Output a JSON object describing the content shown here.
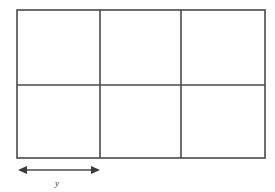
{
  "figure": {
    "title": "",
    "background_color": "#ffffff",
    "line_color": "#4a4a4a",
    "label_color": "#3a3a3a",
    "line_width": 1.6
  },
  "grid": {
    "columns": 3,
    "rows": 2,
    "outer": {
      "x": 17,
      "y": 10,
      "width": 248,
      "height": 148
    },
    "vertical_dividers_x": [
      100,
      181
    ],
    "horizontal_dividers_y": [
      85
    ],
    "cells": [
      {
        "name": "cell-r1-c1",
        "row": 1,
        "col": 1,
        "label": ""
      },
      {
        "name": "cell-r1-c2",
        "row": 1,
        "col": 2,
        "label": ""
      },
      {
        "name": "cell-r1-c3",
        "row": 1,
        "col": 3,
        "label": ""
      },
      {
        "name": "cell-r2-c1",
        "row": 2,
        "col": 1,
        "label": ""
      },
      {
        "name": "cell-r2-c2",
        "row": 2,
        "col": 2,
        "label": ""
      },
      {
        "name": "cell-r2-c3",
        "row": 2,
        "col": 3,
        "label": ""
      }
    ]
  },
  "dimension": {
    "label": "y",
    "arrow": {
      "x_start": 18,
      "x_end": 100,
      "y": 170,
      "double_headed": true,
      "head_length": 8,
      "head_half_width": 4
    },
    "label_position": {
      "x": 57,
      "y": 186
    }
  }
}
